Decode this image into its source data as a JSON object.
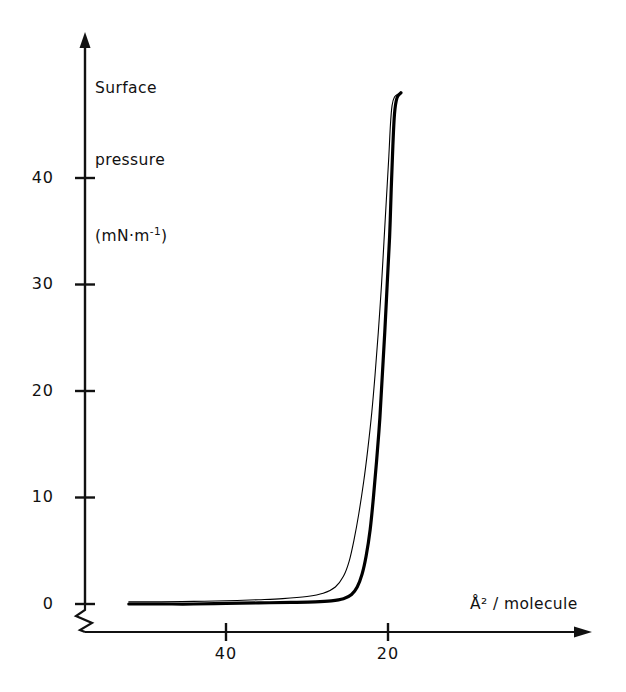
{
  "chart_data": {
    "type": "line",
    "title": "",
    "subtitle": "",
    "xlabel": "Å² / molecule",
    "ylabel": "Surface pressure (mN·m⁻¹)",
    "ylabel_lines": [
      "Surface",
      "pressure",
      "(mN·m",
      "-1",
      ")"
    ],
    "xticks": [
      40,
      20
    ],
    "xtick_labels": [
      "40",
      "20"
    ],
    "yticks": [
      0,
      10,
      20,
      30,
      40
    ],
    "ytick_labels": [
      "0",
      "10",
      "20",
      "30",
      "40"
    ],
    "xlim": [
      52,
      11
    ],
    "ylim": [
      0,
      49
    ],
    "x_axis_reversed": true,
    "x_axis_broken": true,
    "grid": false,
    "legend": null,
    "axis_arrows": {
      "x": "right",
      "y": "up"
    },
    "series": [
      {
        "name": "compression-isotherm-thick",
        "style": "solid-thick",
        "color": "#000000",
        "linewidth": 3.2,
        "points": [
          [
            52.0,
            0.2
          ],
          [
            48.0,
            0.2
          ],
          [
            44.0,
            0.25
          ],
          [
            40.0,
            0.3
          ],
          [
            36.0,
            0.4
          ],
          [
            33.0,
            0.5
          ],
          [
            30.0,
            0.7
          ],
          [
            28.0,
            1.0
          ],
          [
            26.5,
            1.6
          ],
          [
            25.5,
            2.6
          ],
          [
            24.8,
            4.0
          ],
          [
            24.2,
            6.0
          ],
          [
            23.6,
            8.5
          ],
          [
            23.0,
            11.5
          ],
          [
            22.5,
            14.5
          ],
          [
            22.0,
            18.0
          ],
          [
            21.6,
            21.5
          ],
          [
            21.2,
            25.5
          ],
          [
            20.8,
            30.0
          ],
          [
            20.5,
            34.0
          ],
          [
            20.2,
            38.0
          ],
          [
            19.9,
            42.0
          ],
          [
            19.7,
            45.0
          ],
          [
            19.5,
            46.8
          ],
          [
            19.2,
            47.6
          ],
          [
            18.7,
            47.9
          ]
        ]
      },
      {
        "name": "compression-isotherm-thin",
        "style": "solid-thin",
        "color": "#000000",
        "linewidth": 1.1,
        "points": [
          [
            52.0,
            0.0
          ],
          [
            48.0,
            0.0
          ],
          [
            44.0,
            0.0
          ],
          [
            40.0,
            0.05
          ],
          [
            36.0,
            0.1
          ],
          [
            32.0,
            0.15
          ],
          [
            29.0,
            0.2
          ],
          [
            27.0,
            0.3
          ],
          [
            25.5,
            0.5
          ],
          [
            24.5,
            0.9
          ],
          [
            23.8,
            1.6
          ],
          [
            23.2,
            2.8
          ],
          [
            22.7,
            4.5
          ],
          [
            22.2,
            7.0
          ],
          [
            21.8,
            10.0
          ],
          [
            21.4,
            13.5
          ],
          [
            21.0,
            17.5
          ],
          [
            20.7,
            21.5
          ],
          [
            20.4,
            25.5
          ],
          [
            20.1,
            30.0
          ],
          [
            19.8,
            34.5
          ],
          [
            19.6,
            39.0
          ],
          [
            19.4,
            43.0
          ],
          [
            19.2,
            46.0
          ],
          [
            18.9,
            47.5
          ],
          [
            18.4,
            48.0
          ]
        ]
      }
    ]
  },
  "geometry": {
    "origin_px": {
      "x": 85,
      "y": 604
    },
    "x_40_px": 226,
    "x_20_px": 388,
    "y_40_px": 178,
    "y_step_px": 106.5,
    "x_axis_line_y": 632,
    "x_axis_end": 592,
    "y_axis_top": 34
  }
}
